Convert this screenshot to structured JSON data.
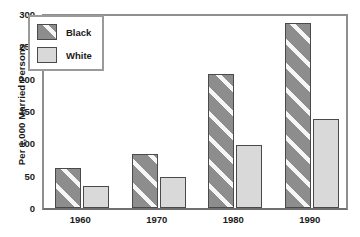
{
  "chart_data": {
    "type": "bar",
    "title": "",
    "xlabel": "",
    "ylabel": "Per 1,000 Married Persons",
    "categories": [
      "1960",
      "1970",
      "1980",
      "1990"
    ],
    "series": [
      {
        "name": "Black",
        "values": [
          62,
          83,
          208,
          286
        ],
        "color": "#8d8d8d",
        "pattern": "diagonal-hatch"
      },
      {
        "name": "White",
        "values": [
          34,
          48,
          97,
          138
        ],
        "color": "#d9d9d9",
        "pattern": "solid"
      }
    ],
    "ylim": [
      0,
      300
    ],
    "yticks": [
      0,
      50,
      100,
      150,
      200,
      250,
      300
    ],
    "grid": false,
    "legend_position": "upper-left"
  }
}
